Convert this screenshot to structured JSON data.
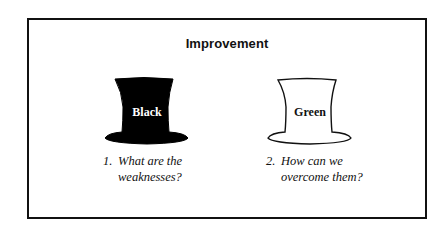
{
  "diagram": {
    "title": "Improvement",
    "colors": {
      "border": "#111111",
      "background": "#ffffff",
      "black_hat_fill": "#000000",
      "green_hat_fill": "#ffffff"
    },
    "hats": [
      {
        "label": "Black",
        "style": "filled-black",
        "caption": {
          "number": "1.",
          "line1": "What are the",
          "line2": "weaknesses?"
        }
      },
      {
        "label": "Green",
        "style": "outline",
        "caption": {
          "number": "2.",
          "line1": "How can we",
          "line2": "overcome them?"
        }
      }
    ]
  }
}
